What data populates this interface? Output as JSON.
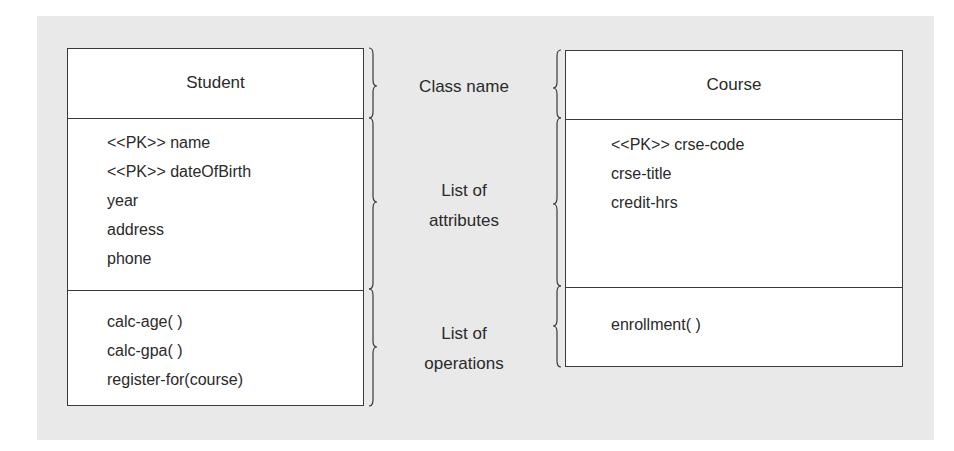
{
  "diagram": {
    "type": "UML class notation",
    "labels": {
      "class_name": "Class name",
      "attributes": [
        "List of",
        "attributes"
      ],
      "operations": [
        "List of",
        "operations"
      ]
    },
    "classes": [
      {
        "name": "Student",
        "attributes": [
          "<<PK>> name",
          "<<PK>> dateOfBirth",
          "year",
          "address",
          "phone"
        ],
        "operations": [
          "calc-age( )",
          "calc-gpa( )",
          "register-for(course)"
        ]
      },
      {
        "name": "Course",
        "attributes": [
          "<<PK>> crse-code",
          "crse-title",
          "credit-hrs"
        ],
        "operations": [
          "enrollment( )"
        ]
      }
    ],
    "colors": {
      "panel_background": "#e9e9e9",
      "box_fill": "#ffffff",
      "line": "#3a3a3a",
      "text": "#2a2a2a"
    }
  }
}
